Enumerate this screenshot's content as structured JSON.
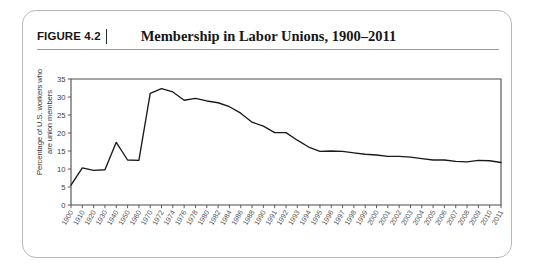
{
  "figure": {
    "number_label": "FIGURE 4.2",
    "title": "Membership in Labor Unions, 1900–2011"
  },
  "chart_data": {
    "type": "line",
    "title": "Membership in Labor Unions, 1900–2011",
    "xlabel": "",
    "ylabel": "Percentage of U.S. workers who are union members",
    "ylabel_line1": "Percentage of U.S. workers who",
    "ylabel_line2": "are union members",
    "ylim": [
      0,
      35
    ],
    "ytick_step": 5,
    "yticks": [
      0,
      5,
      10,
      15,
      20,
      25,
      30,
      35
    ],
    "ytick_labels": [
      "0",
      "5",
      "10",
      "15",
      "20",
      "25",
      "30",
      "35"
    ],
    "grid": false,
    "legend": false,
    "categories": [
      "1900",
      "1910",
      "1920",
      "1930",
      "1940",
      "1950",
      "1960",
      "1970",
      "1972",
      "1974",
      "1976",
      "1978",
      "1980",
      "1982",
      "1984",
      "1986",
      "1988",
      "1990",
      "1991",
      "1992",
      "1993",
      "1994",
      "1995",
      "1996",
      "1997",
      "1998",
      "1999",
      "2000",
      "2001",
      "2002",
      "2003",
      "2004",
      "2005",
      "2006",
      "2007",
      "2008",
      "2009",
      "2010",
      "2011"
    ],
    "values": [
      5.5,
      10.3,
      9.6,
      9.8,
      17.4,
      12.5,
      12.4,
      31.0,
      32.3,
      31.4,
      29.1,
      29.6,
      28.9,
      28.4,
      27.3,
      25.5,
      23.0,
      21.9,
      20.1,
      20.1,
      18.0,
      16.1,
      14.9,
      15.0,
      14.9,
      14.5,
      14.1,
      13.9,
      13.5,
      13.5,
      13.3,
      12.9,
      12.5,
      12.5,
      12.1,
      12.0,
      12.4,
      12.3,
      11.8
    ],
    "series_note": "single series",
    "endpoint_value": 11.8,
    "peak_value": 32.3
  }
}
